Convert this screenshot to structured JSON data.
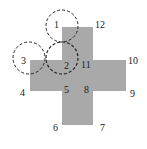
{
  "diagram": {
    "shape": "cross",
    "fill_color": "#a9a9a9",
    "circle_stroke_color": "#222222",
    "circle_style": "dashed",
    "vertex_labels": [
      "12",
      "11",
      "10",
      "9",
      "8",
      "7",
      "6",
      "5",
      "4"
    ],
    "circle_labels": [
      "1",
      "2",
      "3"
    ]
  }
}
